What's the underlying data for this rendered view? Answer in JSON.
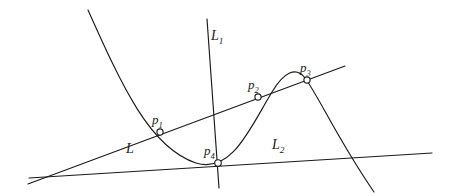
{
  "figure": {
    "kind": "geometry-diagram",
    "background_color": "#ffffff",
    "stroke_color": "#1a1a1a",
    "width": 451,
    "height": 196,
    "labels": {
      "curve_points": [
        {
          "id": "p1",
          "base": "p",
          "sub": "1"
        },
        {
          "id": "p2",
          "base": "p",
          "sub": "2"
        },
        {
          "id": "p3",
          "base": "p",
          "sub": "3"
        },
        {
          "id": "p4",
          "base": "p",
          "sub": "4"
        }
      ],
      "lines": [
        {
          "id": "L",
          "base": "L",
          "sub": ""
        },
        {
          "id": "L1",
          "base": "L",
          "sub": "1"
        },
        {
          "id": "L2",
          "base": "L",
          "sub": "2"
        }
      ]
    }
  },
  "chart_data": {
    "type": "line",
    "title": "",
    "xlabel": "",
    "ylabel": "",
    "xlim": [
      0,
      451
    ],
    "ylim": [
      196,
      0
    ],
    "grid": false,
    "legend": null,
    "note": "Pixel coordinates, y axis increases downward (screen space).",
    "series": [
      {
        "name": "cubic-curve",
        "kind": "cubic",
        "path": "M 88 10 C 122 86, 150 148, 196 163 C 232 174, 250 128, 272 92 C 284 72, 296 66, 305 78 C 318 95, 338 140, 374 192",
        "features": {
          "start": [
            88,
            10
          ],
          "end": [
            374,
            192
          ],
          "local_minimum": [
            196,
            166
          ],
          "local_maximum": [
            285,
            70
          ]
        }
      },
      {
        "name": "line-L",
        "kind": "straight",
        "from": [
          28,
          184
        ],
        "to": [
          345,
          66
        ]
      },
      {
        "name": "line-L1",
        "kind": "straight",
        "from": [
          207,
          19
        ],
        "to": [
          219,
          188
        ]
      },
      {
        "name": "line-L2",
        "kind": "straight",
        "from": [
          29,
          178
        ],
        "to": [
          432,
          153
        ]
      }
    ],
    "marked_points": [
      {
        "label": "p1",
        "x": 160,
        "y": 132,
        "on": [
          "cubic-curve",
          "line-L"
        ]
      },
      {
        "label": "p2",
        "x": 258,
        "y": 97,
        "on": [
          "cubic-curve",
          "line-L"
        ]
      },
      {
        "label": "p3",
        "x": 307,
        "y": 80,
        "on": [
          "cubic-curve",
          "line-L"
        ]
      },
      {
        "label": "p4",
        "x": 218,
        "y": 163,
        "on": [
          "cubic-curve",
          "line-L1",
          "line-L2"
        ]
      }
    ]
  }
}
